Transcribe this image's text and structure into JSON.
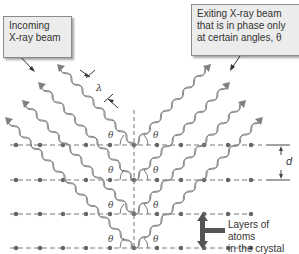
{
  "callouts": {
    "incoming": {
      "line1": "Incoming",
      "line2": "X-ray beam"
    },
    "exiting": {
      "line1": "Exiting X-ray beam",
      "line2": "that is in phase only",
      "line3": "at certain angles, θ"
    }
  },
  "labels": {
    "wavelength": "λ",
    "spacing": "d",
    "theta": "θ",
    "layers_line1": "Layers of atoms",
    "layers_line2": "in the crystal"
  },
  "lattice": {
    "rows_y": [
      145,
      180,
      214,
      248
    ],
    "atoms_x": [
      16,
      40,
      63,
      86,
      110,
      134,
      157,
      181,
      204,
      228,
      251
    ],
    "axis_x": 134
  },
  "colors": {
    "beam": "#808080",
    "lattice": "#7a7a7a",
    "callout_bg": "#ececec",
    "arrow": "#555555"
  }
}
